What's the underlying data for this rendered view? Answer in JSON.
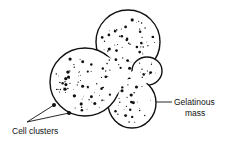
{
  "figure": {
    "ink_color": "#111111",
    "background_color": "#ffffff"
  },
  "labels": {
    "cell_clusters": "Cell clusters",
    "gelatinous_mass_line1": "Gelatinous",
    "gelatinous_mass_line2": "mass"
  },
  "lobes": [
    "left-lobe",
    "top-lobe",
    "right-small-lobe",
    "bottom-lobe"
  ]
}
